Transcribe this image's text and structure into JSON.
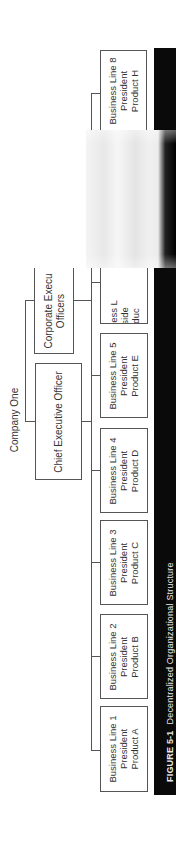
{
  "figure": {
    "number_label": "FIGURE 5-1",
    "title": "Decentralized Organizational Structure",
    "orientation": "rotated 90° counter-clockwise"
  },
  "org_chart": {
    "root": "Company One",
    "executives": [
      {
        "label": "Chief Executive Officer"
      },
      {
        "label": "Corporate Executive Officers",
        "visible_text": [
          "Corporate Execu",
          "Officers"
        ]
      }
    ],
    "business_lines": [
      {
        "line": "Business Line 1",
        "role": "President",
        "product": "Product A"
      },
      {
        "line": "Business Line 2",
        "role": "President",
        "product": "Product B"
      },
      {
        "line": "Business Line 3",
        "role": "President",
        "product": "Product C"
      },
      {
        "line": "Business Line 4",
        "role": "President",
        "product": "Product D"
      },
      {
        "line": "Business Line 5",
        "role": "President",
        "product": "Product E"
      },
      {
        "line": "Business L",
        "role": "Preside",
        "product": "Produc"
      },
      {
        "line": "Business Line 8",
        "role": "President",
        "product": "Product H"
      }
    ]
  },
  "colors": {
    "caption_bg": "#0a0a0a",
    "caption_text": "#e8e8e8",
    "line": "#555555",
    "text": "#333333"
  }
}
